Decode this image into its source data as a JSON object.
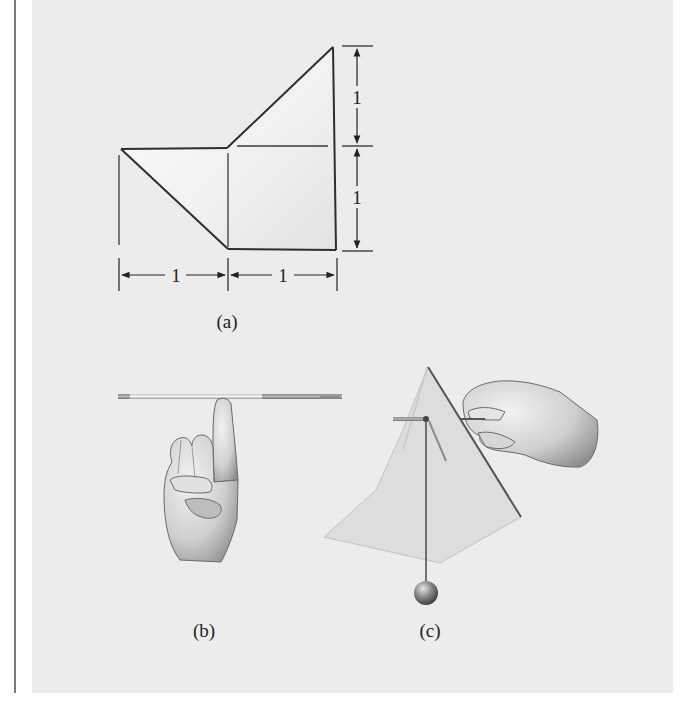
{
  "figure": {
    "panels": [
      {
        "id": "a",
        "caption": "(a)",
        "description": "Flat cut-out shape with dimensions",
        "dimensions": {
          "horizontal": [
            "1",
            "1"
          ],
          "vertical": [
            "1",
            "1"
          ]
        }
      },
      {
        "id": "b",
        "caption": "(b)",
        "description": "Rod balanced on a fingertip"
      },
      {
        "id": "c",
        "caption": "(c)",
        "description": "Cut-out suspended from a pin with a plumb line"
      }
    ]
  },
  "colors": {
    "panel_background": "#ececec",
    "line": "#333333",
    "margin_rule": "#7a7a7a"
  }
}
